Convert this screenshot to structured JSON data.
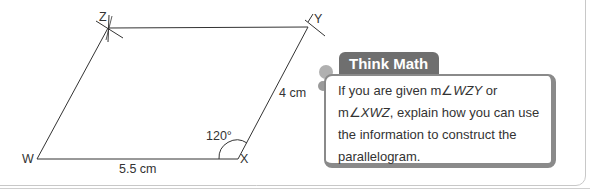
{
  "diagram": {
    "vertices": {
      "W": {
        "label": "W"
      },
      "X": {
        "label": "X"
      },
      "Y": {
        "label": "Y"
      },
      "Z": {
        "label": "Z"
      }
    },
    "side_wx": "5.5 cm",
    "side_xy": "4 cm",
    "angle_x": "120°"
  },
  "think_math": {
    "title": "Think Math",
    "line1_a": "If you are given m∠",
    "line1_b": "WZY",
    "line1_c": " or",
    "line2_a": "m∠",
    "line2_b": "XWZ",
    "line2_c": ", explain how you can use",
    "line3": "the information to construct the",
    "line4": "parallelogram."
  },
  "colors": {
    "tab": "#6f6f6f",
    "border": "#8a8a8a",
    "line": "#333333"
  }
}
